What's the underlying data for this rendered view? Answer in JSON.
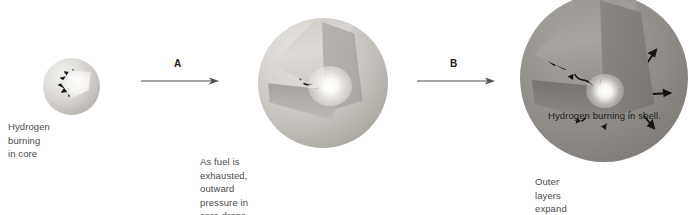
{
  "diagram": {
    "background_color": "#ffffff",
    "text_color": "#4a4a4a"
  },
  "stages": [
    {
      "id": "stage-one",
      "label": "Hydrogen burning in core",
      "sphere_name": "main-sequence-star-sphere",
      "core_state": "hydrogen burning in core",
      "sphere_diameter_px": 57
    },
    {
      "id": "stage-two",
      "label": "As fuel is exhausted, outward pressure in core drops, and\ngravity compresses it. Core contracts. Outer layers expand.\nRising heat in contracting core creates pressure that causes\nouter layers to expand. Shell of H outside core ignites.",
      "sphere_name": "contracting-core-star-sphere",
      "core_state": "core contracting, outer layers expanding",
      "sphere_diameter_px": 130
    },
    {
      "id": "stage-three",
      "label": "Outer layers expand and cool.\nA red giant forms.",
      "inner_label": "Hydrogen burning in shell.",
      "sphere_name": "red-giant-star-sphere",
      "core_state": "hydrogen burning in shell",
      "sphere_diameter_px": 168
    }
  ],
  "arrows": [
    {
      "id": "arrow-a",
      "label": "A",
      "direction": "right"
    },
    {
      "id": "arrow-b",
      "label": "B",
      "direction": "right"
    }
  ],
  "colors": {
    "star_light": "#e2e0dd",
    "star_mid": "#c2bfba",
    "star_dark": "#8e8b86",
    "core_glow": "#ffffff",
    "arrow_stroke": "#1a1a1a",
    "label_text": "#4a4a4a"
  }
}
